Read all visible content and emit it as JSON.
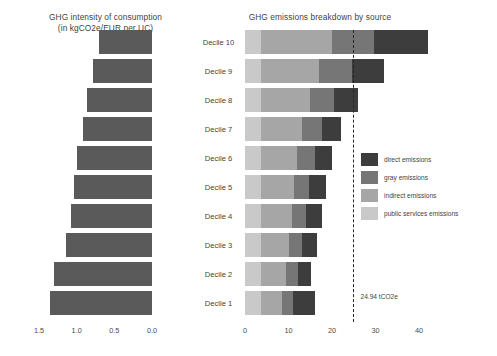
{
  "chart_data": [
    {
      "type": "bar",
      "id": "ghg-intensity",
      "title": "GHG intensity of consumption\n(in kgCO2e/EUR per UC)",
      "title_line1": "GHG intensity of consumption",
      "title_line2": "(in kgCO2e/EUR per UC)",
      "orientation": "horizontal",
      "xlabel": "",
      "ylabel": "",
      "xlim": [
        1.5,
        0.0
      ],
      "x_axis_reversed": true,
      "xticks": [
        "1.5",
        "1.0",
        "0.5",
        "0.0"
      ],
      "xtick_values": [
        1.5,
        1.0,
        0.5,
        0.0
      ],
      "grid": false,
      "legend": "none",
      "categories": [
        "Decile 10",
        "Decile 9",
        "Decile 8",
        "Decile 7",
        "Decile 6",
        "Decile 5",
        "Decile 4",
        "Decile 3",
        "Decile 2",
        "Decile 1"
      ],
      "values": [
        0.71,
        0.79,
        0.86,
        0.92,
        0.99,
        1.03,
        1.07,
        1.14,
        1.3,
        1.35
      ],
      "series": [
        {
          "name": "GHG intensity",
          "color": "#5a5a5a",
          "values": [
            0.71,
            0.79,
            0.86,
            0.92,
            0.99,
            1.03,
            1.07,
            1.14,
            1.3,
            1.35
          ]
        }
      ]
    },
    {
      "type": "bar",
      "id": "ghg-breakdown",
      "title": "GHG emissions breakdown by source",
      "orientation": "horizontal",
      "stacked": true,
      "xlabel": "",
      "ylabel": "",
      "xlim": [
        0,
        45
      ],
      "xticks": [
        "0",
        "10",
        "20",
        "30",
        "40"
      ],
      "xtick_values": [
        0,
        10,
        20,
        30,
        40
      ],
      "grid": false,
      "legend_position": "right",
      "categories": [
        "Decile 10",
        "Decile 9",
        "Decile 8",
        "Decile 7",
        "Decile 6",
        "Decile 5",
        "Decile 4",
        "Decile 3",
        "Decile 2",
        "Decile 1"
      ],
      "series": [
        {
          "name": "public services emissions",
          "color": "#c9c9c9",
          "values": [
            3.6,
            3.6,
            3.6,
            3.6,
            3.6,
            3.6,
            3.6,
            3.6,
            3.6,
            3.6
          ]
        },
        {
          "name": "indirect emissions",
          "color": "#a6a6a6",
          "values": [
            16.4,
            13.4,
            11.4,
            9.6,
            8.4,
            7.6,
            7.2,
            6.6,
            5.9,
            4.9
          ]
        },
        {
          "name": "gray emissions",
          "color": "#767676",
          "values": [
            9.6,
            7.6,
            5.4,
            4.4,
            4.0,
            3.6,
            3.2,
            3.0,
            2.6,
            2.6
          ]
        },
        {
          "name": "direct emissions",
          "color": "#3d3d3d",
          "values": [
            12.4,
            7.4,
            5.6,
            4.4,
            4.0,
            3.8,
            3.6,
            3.4,
            3.1,
            5.0
          ]
        }
      ],
      "totals": [
        42.0,
        32.0,
        26.0,
        22.0,
        20.0,
        18.6,
        17.6,
        16.6,
        15.2,
        16.1
      ],
      "reference_line": {
        "value": 24.94,
        "label": "24.94 tCO2e",
        "style": "dashed",
        "color": "#262626"
      }
    }
  ],
  "titles": {
    "left_line1": "GHG intensity of consumption",
    "left_line2": "(in kgCO2e/EUR per UC)",
    "right": "GHG emissions breakdown by source"
  },
  "legend": {
    "items": [
      {
        "label": "direct emissions",
        "color": "#3d3d3d"
      },
      {
        "label": "gray emissions",
        "color": "#767676"
      },
      {
        "label": "indirect emissions",
        "color": "#a6a6a6"
      },
      {
        "label": "public services emissions",
        "color": "#c9c9c9"
      }
    ]
  },
  "annotation": {
    "reference_label": "24.94 tCO2e"
  }
}
